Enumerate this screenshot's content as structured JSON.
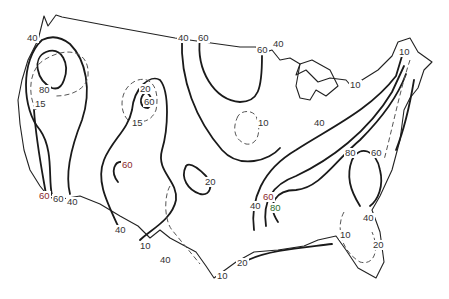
{
  "map": {
    "type": "contour-map",
    "region": "Contiguous United States",
    "line_styles": {
      "solid": "major isolines (40, 60, 80, 20)",
      "dashed": "minor isolines (10, 15, 20)"
    },
    "labels": [
      {
        "id": "l0",
        "text": "40",
        "x": 26,
        "y": 38,
        "tone": "normal"
      },
      {
        "id": "l1",
        "text": "80",
        "x": 40,
        "y": 88,
        "tone": "normal"
      },
      {
        "id": "l2",
        "text": "15",
        "x": 33,
        "y": 102,
        "tone": "normal"
      },
      {
        "id": "l3",
        "text": "20",
        "x": 139,
        "y": 83,
        "tone": "normal"
      },
      {
        "id": "l4",
        "text": "60",
        "x": 143,
        "y": 100,
        "tone": "normal"
      },
      {
        "id": "l5",
        "text": "15",
        "x": 131,
        "y": 120,
        "tone": "normal"
      },
      {
        "id": "l6",
        "text": "60",
        "x": 120,
        "y": 160,
        "tone": "red"
      },
      {
        "id": "l7",
        "text": "40",
        "x": 178,
        "y": 35,
        "tone": "normal"
      },
      {
        "id": "l8",
        "text": "60",
        "x": 197,
        "y": 35,
        "tone": "normal"
      },
      {
        "id": "l9",
        "text": "60",
        "x": 256,
        "y": 46,
        "tone": "normal"
      },
      {
        "id": "l10",
        "text": "40",
        "x": 272,
        "y": 39,
        "tone": "normal"
      },
      {
        "id": "l11",
        "text": "10",
        "x": 256,
        "y": 118,
        "tone": "normal"
      },
      {
        "id": "l12",
        "text": "10",
        "x": 397,
        "y": 47,
        "tone": "normal"
      },
      {
        "id": "l13",
        "text": "10",
        "x": 349,
        "y": 80,
        "tone": "normal"
      },
      {
        "id": "l14",
        "text": "40",
        "x": 312,
        "y": 118,
        "tone": "normal"
      },
      {
        "id": "l15",
        "text": "80",
        "x": 344,
        "y": 148,
        "tone": "normal"
      },
      {
        "id": "l16",
        "text": "60",
        "x": 370,
        "y": 148,
        "tone": "normal"
      },
      {
        "id": "l17",
        "text": "20",
        "x": 204,
        "y": 177,
        "tone": "normal"
      },
      {
        "id": "l18",
        "text": "60",
        "x": 261,
        "y": 193,
        "tone": "red"
      },
      {
        "id": "l19",
        "text": "40",
        "x": 250,
        "y": 202,
        "tone": "normal"
      },
      {
        "id": "l20",
        "text": "80",
        "x": 270,
        "y": 203,
        "tone": "green"
      },
      {
        "id": "l21",
        "text": "60",
        "x": 38,
        "y": 191,
        "tone": "red"
      },
      {
        "id": "l22",
        "text": "60",
        "x": 52,
        "y": 193,
        "tone": "normal"
      },
      {
        "id": "l23",
        "text": "40",
        "x": 66,
        "y": 196,
        "tone": "normal"
      },
      {
        "id": "l24",
        "text": "40",
        "x": 114,
        "y": 225,
        "tone": "normal"
      },
      {
        "id": "l25",
        "text": "40",
        "x": 161,
        "y": 256,
        "tone": "normal"
      },
      {
        "id": "l26",
        "text": "10",
        "x": 139,
        "y": 241,
        "tone": "normal"
      },
      {
        "id": "l27",
        "text": "40",
        "x": 159,
        "y": 255,
        "tone": "normal"
      },
      {
        "id": "l28",
        "text": "10",
        "x": 216,
        "y": 270,
        "tone": "normal"
      },
      {
        "id": "l29",
        "text": "20",
        "x": 236,
        "y": 258,
        "tone": "normal"
      },
      {
        "id": "l30",
        "text": "40",
        "x": 362,
        "y": 215,
        "tone": "normal"
      },
      {
        "id": "l31",
        "text": "10",
        "x": 339,
        "y": 233,
        "tone": "normal"
      },
      {
        "id": "l32",
        "text": "20",
        "x": 372,
        "y": 241,
        "tone": "normal"
      }
    ]
  }
}
